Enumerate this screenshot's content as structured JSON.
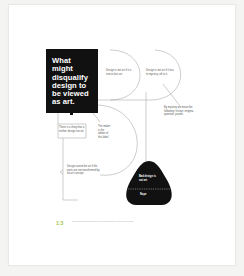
{
  "title": "What might disqualify design to be viewed as art.",
  "title_lines": [
    "What",
    "might",
    "disqualify",
    "design to",
    "be viewed",
    "as art."
  ],
  "notes": {
    "non_in_fact": "Design is not art if it is non-in-fact art.",
    "mystery": "Design is not art if it has to mystery, aft to it.",
    "mystery_def": "By mystery we mean the following: friction, enigma, question, puzzle.",
    "neither": "There is a thing that is neither design nor art.",
    "maker": "The maker is the arbiter of this label.",
    "transcended": "Design cannot be art if the parts are not transformed by an art concept."
  },
  "verdict": {
    "top": "Bad design is not art",
    "bottom": "Nope"
  },
  "figure": {
    "number": "1:3",
    "caption": "A map of considerations that might disqualify design from being considered art, drawn as a decision diagram."
  },
  "colors": {
    "ink": "#111111",
    "accent": "#9bc43c",
    "line": "#999999"
  }
}
